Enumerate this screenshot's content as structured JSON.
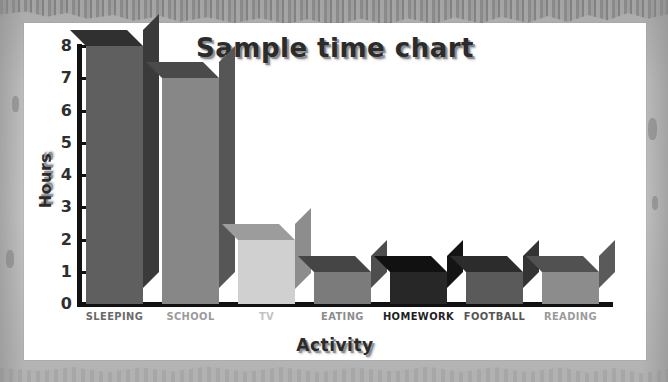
{
  "chart_data": {
    "type": "bar",
    "title": "Sample time chart",
    "xlabel": "Activity",
    "ylabel": "Hours",
    "categories": [
      "SLEEPING",
      "SCHOOL",
      "TV",
      "EATING",
      "HOMEWORK",
      "FOOTBALL",
      "READING"
    ],
    "values": [
      8,
      7,
      2,
      1,
      1,
      1,
      1
    ],
    "ylim": [
      0,
      8
    ],
    "yticks": [
      "0",
      "1",
      "2",
      "3",
      "4",
      "5",
      "6",
      "7",
      "8"
    ],
    "grid": false,
    "legend": false,
    "style": "3d-bar",
    "bar_colors": [
      "#5f5f5f",
      "#878787",
      "#d0d0d0",
      "#7b7b7b",
      "#272727",
      "#5a5a5a",
      "#8c8c8c"
    ],
    "bar_side_colors": [
      "#3a3a3a",
      "#565656",
      "#8d8d8d",
      "#4e4e4e",
      "#141414",
      "#343434",
      "#5a5a5a"
    ],
    "bar_top_colors": [
      "#303030",
      "#4a4a4a",
      "#9c9c9c",
      "#454545",
      "#111111",
      "#2c2c2c",
      "#515151"
    ],
    "label_colors": [
      "#6a6a6a",
      "#9b9b9b",
      "#c3c3c3",
      "#8d8d8d",
      "#1f1f1f",
      "#565656",
      "#9b9b9b"
    ]
  },
  "theme": {
    "frame_color": "#b9b9b9",
    "card_color": "#ffffff",
    "axis_color": "#111111",
    "tick_label_color": "#2f2f2f",
    "title_color": "#2b2b2b"
  }
}
